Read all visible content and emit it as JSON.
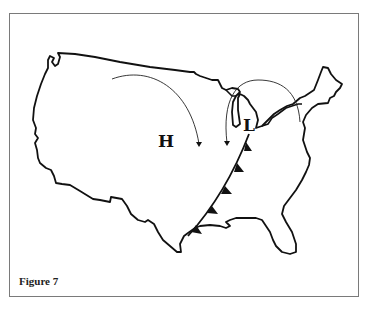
{
  "figure": {
    "caption": "Figure 7",
    "labels": {
      "high_pressure": "H",
      "low_pressure": "L"
    },
    "features": {
      "cold_front": "Cold front extending southwest from the low pressure center to the Texas Gulf coast, with triangular markers pointing east",
      "airflow_arrows": [
        "Clockwise arc flowing from the northwest down toward the central US (around the high)",
        "Counter-clockwise arc from the Northeast over the Great Lakes curving south (around the low)"
      ]
    },
    "colors": {
      "outline": "#111111",
      "frame": "#7a7a7a",
      "background": "#ffffff"
    }
  }
}
